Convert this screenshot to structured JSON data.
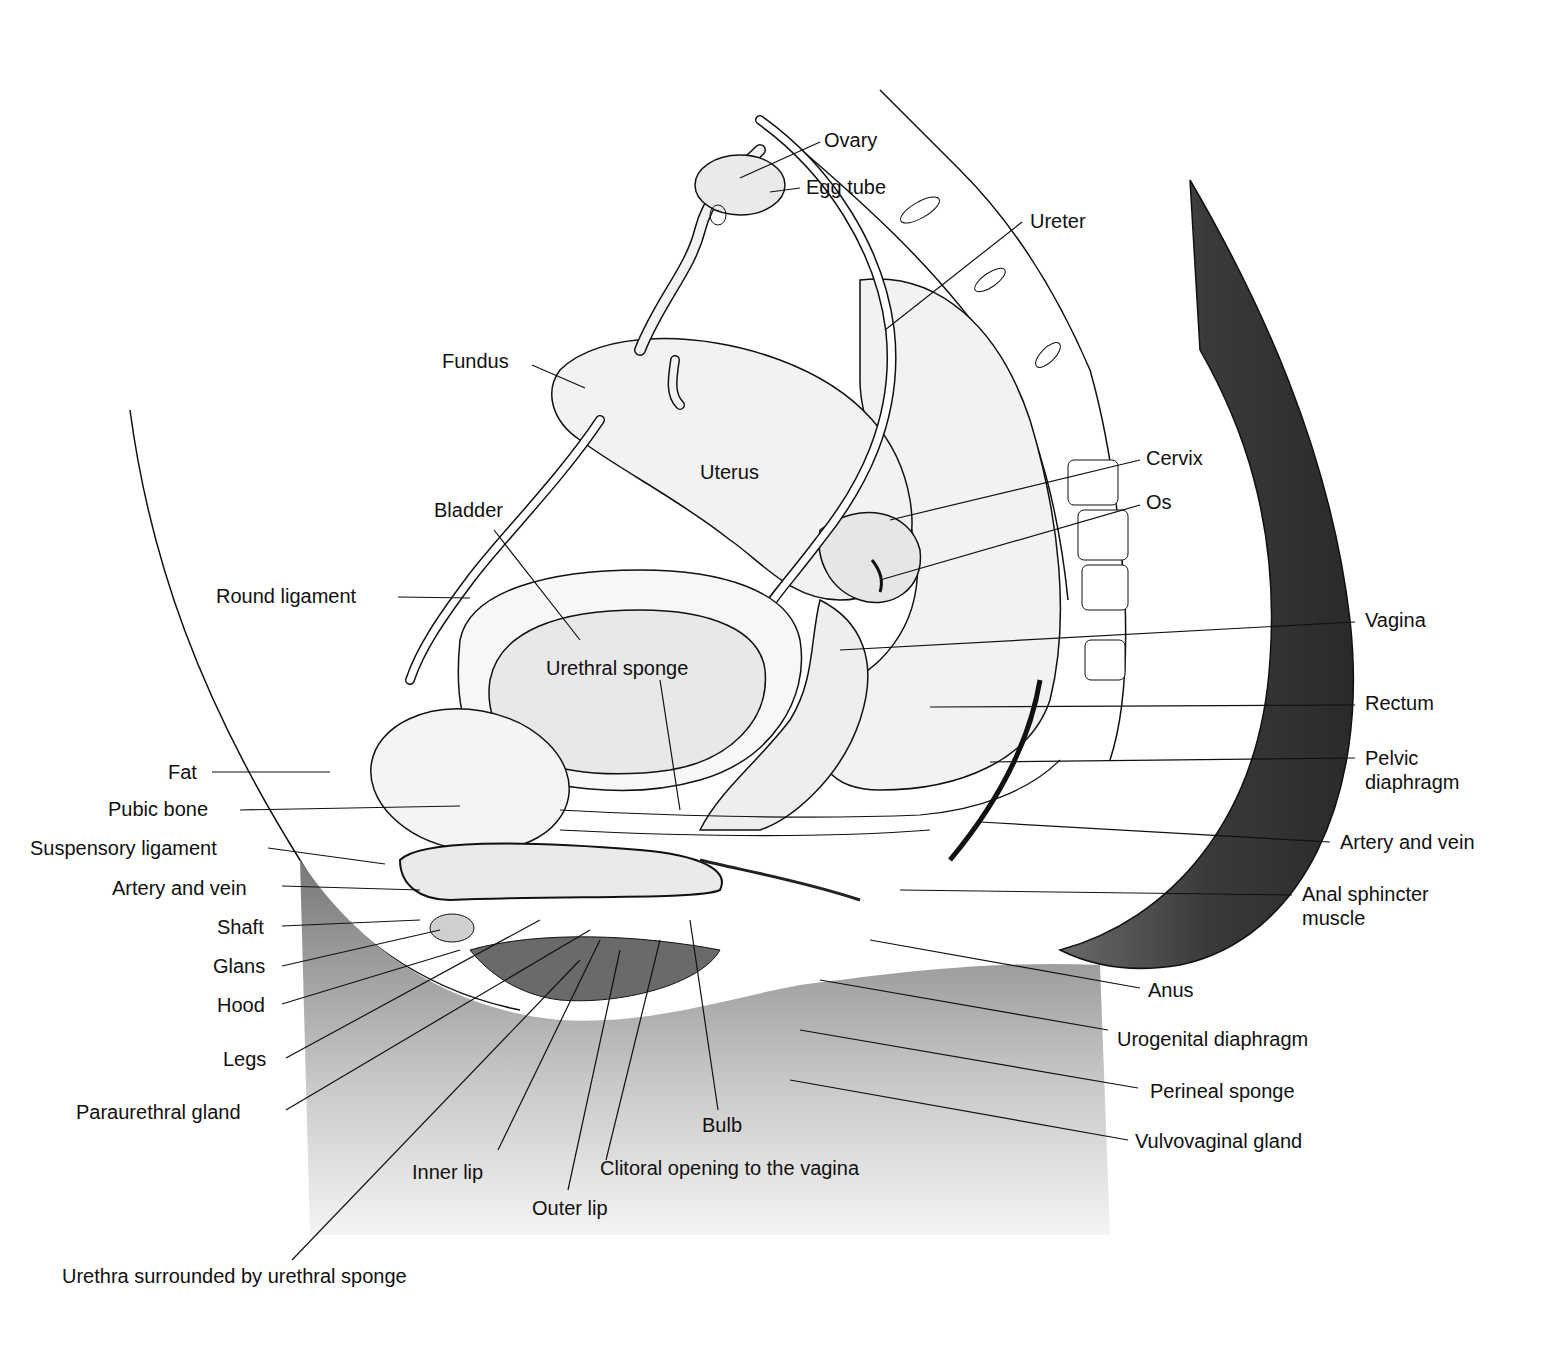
{
  "figure": {
    "colors": {
      "ink": "#111111",
      "background": "#ffffff",
      "skin_shade": "#4a4a4a",
      "skin_light": "#d8d8d8",
      "organ_fill": "#f2f2f2"
    },
    "labels": {
      "ovary": "Ovary",
      "egg_tube": "Egg tube",
      "ureter": "Ureter",
      "fundus": "Fundus",
      "uterus": "Uterus",
      "cervix": "Cervix",
      "os": "Os",
      "bladder": "Bladder",
      "round_ligament": "Round ligament",
      "urethral_sponge": "Urethral sponge",
      "vagina": "Vagina",
      "rectum": "Rectum",
      "pelvic_diaphragm": "Pelvic\ndiaphragm",
      "fat": "Fat",
      "pubic_bone": "Pubic bone",
      "suspensory_ligament": "Suspensory ligament",
      "artery_and_vein_left": "Artery and vein",
      "artery_and_vein_right": "Artery and vein",
      "shaft": "Shaft",
      "glans": "Glans",
      "hood": "Hood",
      "legs": "Legs",
      "paraurethral_gland": "Paraurethral gland",
      "anal_sphincter_muscle": "Anal sphincter\nmuscle",
      "anus": "Anus",
      "urogenital_diaphragm": "Urogenital diaphragm",
      "perineal_sponge": "Perineal sponge",
      "vulvovaginal_gland": "Vulvovaginal gland",
      "bulb": "Bulb",
      "inner_lip": "Inner lip",
      "clitoral_opening": "Clitoral opening to the vagina",
      "outer_lip": "Outer lip",
      "urethra": "Urethra surrounded by urethral sponge"
    }
  }
}
